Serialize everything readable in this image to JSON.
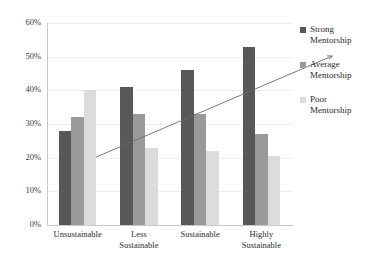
{
  "chart_data": {
    "type": "bar",
    "title": "",
    "xlabel": "",
    "ylabel": "",
    "ylim": [
      0,
      60
    ],
    "ytick_labels": [
      "0%",
      "10%",
      "20%",
      "30%",
      "40%",
      "50%",
      "60%"
    ],
    "ytick_values": [
      0,
      10,
      20,
      30,
      40,
      50,
      60
    ],
    "grid": true,
    "legend_position": "right",
    "categories": [
      "Unsustainable",
      "Less Sustainable",
      "Sustainable",
      "Highly Sustainable"
    ],
    "category_lines": [
      [
        "Unsustainable"
      ],
      [
        "Less",
        "Sustainable"
      ],
      [
        "Sustainable"
      ],
      [
        "Highly",
        "Sustainable"
      ]
    ],
    "series": [
      {
        "name": "Strong Mentorship",
        "color": "#585858",
        "values": [
          28,
          41,
          46,
          53
        ]
      },
      {
        "name": "Average Mentorship",
        "color": "#9a9a9a",
        "values": [
          32,
          33,
          33,
          27
        ]
      },
      {
        "name": "Poor Mentorship",
        "color": "#dcdcdc",
        "values": [
          40,
          23,
          22,
          20.5
        ]
      }
    ],
    "annotations": [
      {
        "type": "trendline-arrow",
        "label": "",
        "start_value": 27,
        "end_value": 57,
        "color": "#6b6b6b"
      }
    ]
  },
  "legend": {
    "items": [
      {
        "label_line1": "Strong",
        "label_line2": "Mentorship",
        "color": "#585858"
      },
      {
        "label_line1": "Average",
        "label_line2": "Mentorship",
        "color": "#9a9a9a"
      },
      {
        "label_line1": "Poor",
        "label_line2": "Mentorship",
        "color": "#dcdcdc"
      }
    ]
  }
}
